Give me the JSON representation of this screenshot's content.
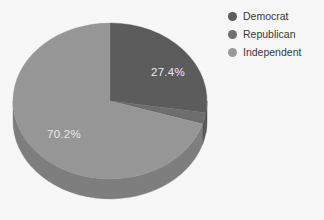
{
  "chart_data": {
    "type": "pie",
    "title": "",
    "subtitle": "",
    "xlabel": "",
    "ylabel": "",
    "legend_position": "right",
    "grid": false,
    "three_d": true,
    "categories": [
      "Democrat",
      "Republican",
      "Independent"
    ],
    "values": [
      27.4,
      2.4,
      70.2
    ],
    "unit": "%",
    "slices": [
      {
        "name": "Democrat",
        "value": 27.4,
        "label": "27.4%",
        "color": "#5e5e5e",
        "side_color": "#4a4a4a",
        "label_visible": true,
        "start_angle_deg": 0,
        "sweep_deg": 98.6
      },
      {
        "name": "Republican",
        "value": 2.4,
        "label": "2.4%",
        "color": "#707070",
        "side_color": "#5a5a5a",
        "label_visible": false,
        "start_angle_deg": 98.6,
        "sweep_deg": 8.6
      },
      {
        "name": "Independent",
        "value": 70.2,
        "label": "70.2%",
        "color": "#9a9a9a",
        "side_color": "#818181",
        "label_visible": true,
        "start_angle_deg": 107.2,
        "sweep_deg": 252.8
      }
    ],
    "data_labels": [
      {
        "text": "27.4%",
        "x": 168,
        "y": 76
      },
      {
        "text": "70.2%",
        "x": 64,
        "y": 138
      }
    ],
    "legend": [
      {
        "label": "Democrat",
        "color": "#5e5e5e"
      },
      {
        "label": "Republican",
        "color": "#727272"
      },
      {
        "label": "Independent",
        "color": "#9c9c9c"
      }
    ],
    "geometry": {
      "center_x": 110,
      "center_y": 101,
      "radius_x": 97,
      "radius_y": 78,
      "depth": 20
    },
    "colors": {
      "background": "#fcfcfc",
      "label_text": "#efefef",
      "legend_text": "#3a3a3a"
    }
  }
}
